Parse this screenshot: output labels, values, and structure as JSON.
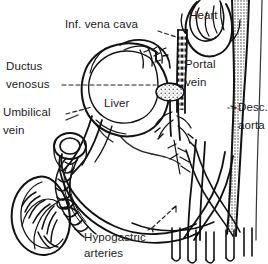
{
  "figure": {
    "type": "anatomical-diagram",
    "background_color": "#ffffff",
    "line_color": "#111111",
    "text_color": "#1a1a1a",
    "width": 268,
    "height": 264
  },
  "labels": {
    "inferior_vena_cava": "Inf. vena cava",
    "heart": "Heart",
    "ductus_venosus_line1": "Ductus",
    "ductus_venosus_line2": "venosus",
    "portal_vein_line1": "Portal",
    "portal_vein_line2": "vein",
    "umbilical_vein_line1": "Umbilical",
    "umbilical_vein_line2": "vein",
    "liver": "Liver",
    "descending_aorta_line1": "Desc.",
    "descending_aorta_line2": "aorta",
    "hypogastric_arteries_line1": "Hypogastric",
    "hypogastric_arteries_line2": "arteries"
  },
  "structures": [
    {
      "name": "heart",
      "label": "Heart"
    },
    {
      "name": "liver",
      "label": "Liver"
    },
    {
      "name": "inferior-vena-cava",
      "label": "Inf. vena cava"
    },
    {
      "name": "ductus-venosus",
      "label": "Ductus venosus"
    },
    {
      "name": "portal-vein",
      "label": "Portal vein"
    },
    {
      "name": "umbilical-vein",
      "label": "Umbilical vein"
    },
    {
      "name": "descending-aorta",
      "label": "Desc. aorta"
    },
    {
      "name": "hypogastric-arteries",
      "label": "Hypogastric arteries"
    },
    {
      "name": "placenta",
      "label": ""
    },
    {
      "name": "umbilical-cord",
      "label": ""
    }
  ]
}
